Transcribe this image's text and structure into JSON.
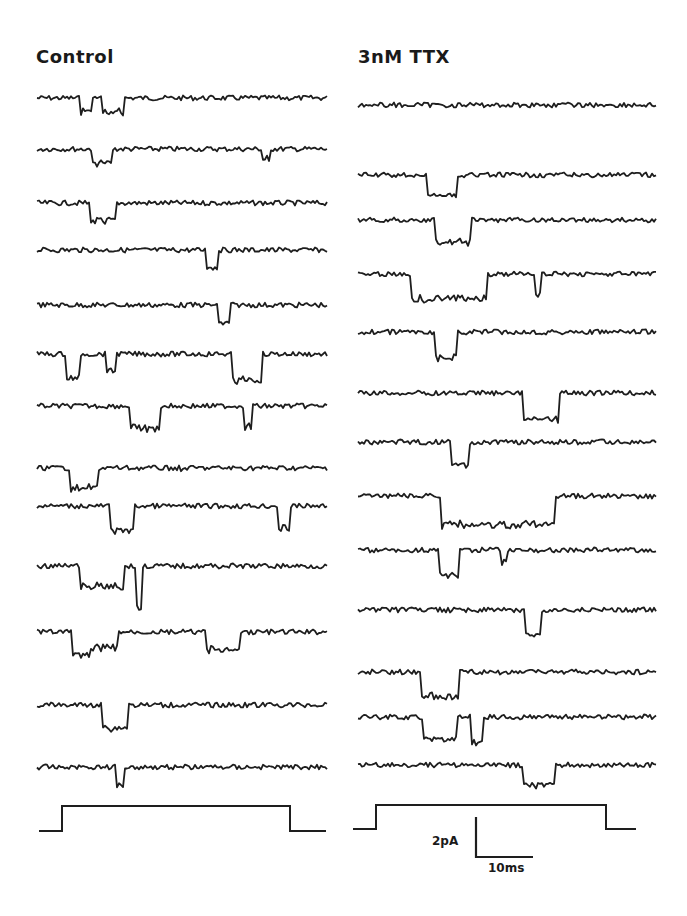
{
  "panels": [
    {
      "title": "Control",
      "x0": 37,
      "x1": 328,
      "traces": [
        {
          "y": 98,
          "events": [
            [
              0.15,
              0.19,
              14
            ],
            [
              0.22,
              0.3,
              16
            ]
          ]
        },
        {
          "y": 149,
          "events": [
            [
              0.19,
              0.26,
              16
            ],
            [
              0.77,
              0.8,
              12
            ]
          ]
        },
        {
          "y": 203,
          "events": [
            [
              0.18,
              0.27,
              20
            ]
          ]
        },
        {
          "y": 250,
          "events": [
            [
              0.58,
              0.62,
              18
            ]
          ]
        },
        {
          "y": 305,
          "events": [
            [
              0.62,
              0.66,
              20
            ]
          ]
        },
        {
          "y": 354,
          "events": [
            [
              0.1,
              0.15,
              26
            ],
            [
              0.24,
              0.27,
              18
            ],
            [
              0.67,
              0.77,
              28
            ]
          ]
        },
        {
          "y": 406,
          "events": [
            [
              0.32,
              0.42,
              24
            ],
            [
              0.71,
              0.74,
              22
            ]
          ]
        },
        {
          "y": 468,
          "events": [
            [
              0.11,
              0.21,
              22
            ],
            [
              0.49,
              0.5,
              6
            ]
          ]
        },
        {
          "y": 506,
          "events": [
            [
              0.25,
              0.33,
              26
            ],
            [
              0.83,
              0.87,
              24
            ]
          ]
        },
        {
          "y": 566,
          "events": [
            [
              0.15,
              0.3,
              22
            ],
            [
              0.34,
              0.36,
              44
            ]
          ]
        },
        {
          "y": 632,
          "events": [
            [
              0.12,
              0.18,
              24
            ],
            [
              0.18,
              0.28,
              18
            ],
            [
              0.58,
              0.7,
              20
            ]
          ]
        },
        {
          "y": 705,
          "events": [
            [
              0.22,
              0.31,
              24
            ]
          ]
        },
        {
          "y": 767,
          "events": [
            [
              0.27,
              0.3,
              20
            ]
          ]
        }
      ],
      "step": {
        "x_start": 39,
        "x_rise": 62,
        "x_fall": 290,
        "x_end": 326,
        "y_high": 806,
        "y_low": 831
      }
    },
    {
      "title": "3nM TTX",
      "x0": 358,
      "x1": 657,
      "traces": [
        {
          "y": 105,
          "events": []
        },
        {
          "y": 175,
          "events": [
            [
              0.23,
              0.33,
              22
            ]
          ]
        },
        {
          "y": 220,
          "events": [
            [
              0.26,
              0.38,
              24
            ]
          ]
        },
        {
          "y": 274,
          "events": [
            [
              0.18,
              0.43,
              26
            ],
            [
              0.59,
              0.61,
              24
            ]
          ]
        },
        {
          "y": 332,
          "events": [
            [
              0.26,
              0.33,
              28
            ]
          ]
        },
        {
          "y": 393,
          "events": [
            [
              0.55,
              0.67,
              28
            ]
          ]
        },
        {
          "y": 442,
          "events": [
            [
              0.31,
              0.37,
              24
            ]
          ]
        },
        {
          "y": 496,
          "events": [
            [
              0.28,
              0.66,
              30
            ]
          ]
        },
        {
          "y": 550,
          "events": [
            [
              0.27,
              0.34,
              26
            ],
            [
              0.48,
              0.5,
              14
            ]
          ]
        },
        {
          "y": 610,
          "events": [
            [
              0.56,
              0.61,
              26
            ]
          ]
        },
        {
          "y": 672,
          "events": [
            [
              0.21,
              0.34,
              26
            ]
          ]
        },
        {
          "y": 717,
          "events": [
            [
              0.22,
              0.33,
              24
            ],
            [
              0.38,
              0.42,
              28
            ]
          ]
        },
        {
          "y": 765,
          "events": [
            [
              0.55,
              0.66,
              22
            ]
          ]
        }
      ],
      "step": {
        "x_start": 353,
        "x_rise": 376,
        "x_fall": 606,
        "x_end": 636,
        "y_high": 805,
        "y_low": 829
      }
    }
  ],
  "scale_bar": {
    "current_label": "2pA",
    "time_label": "10ms",
    "x": 476,
    "y_top": 817,
    "y_bottom": 857,
    "x_end": 533
  },
  "colors": {
    "trace": "#1e1e1e",
    "background": "#ffffff"
  }
}
